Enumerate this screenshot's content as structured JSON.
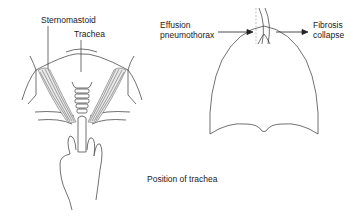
{
  "labels": {
    "sternomastoid": "Sternomastoid",
    "trachea": "Trachea",
    "effusion_line1": "Effusion",
    "effusion_line2": "pneumothorax",
    "fibrosis_line1": "Fibrosis",
    "fibrosis_line2": "collapse",
    "caption": "Position of trachea"
  },
  "colors": {
    "stroke": "#333333",
    "muscle": "#555555",
    "dashed": "#999999"
  }
}
